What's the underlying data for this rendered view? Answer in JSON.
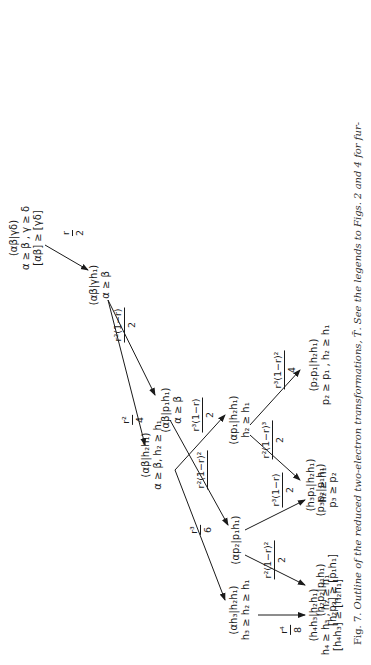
{
  "figure": {
    "caption_label": "Fig. 7.",
    "caption_text": "Outline of the reduced two-electron transformations, T̄. See the legends to Figs. 2 and 4 for fur-"
  },
  "nodes": {
    "root": {
      "l1": "(αβ|γδ)",
      "l2": "α ≥ β , γ ≥ δ",
      "l3": "[αβ] ≥ [γδ]"
    },
    "n_ab_gh1": {
      "l1": "(αβ|γh₁)",
      "l2": "α ≥ β"
    },
    "n_ab_p1h1": {
      "l1": "(αβ|p₁h₁)",
      "l2": "α ≥ β"
    },
    "n_ap2_p1h1": {
      "l1": "(αp₂|p₁h₁)"
    },
    "n_h2p2_p1h1": {
      "l1": "(h₂p₂|p₁h₁)",
      "l2": "[h₂p₂] ≥ [p₁h₁]"
    },
    "n_p3p2_p1h1": {
      "l1": "(p₃p₂|p₁h₁)",
      "l2": "p₃ ≥ p₂"
    },
    "n_ab_h2h1": {
      "l1": "(αβ|h₂h₁)",
      "l2": "α ≥ β, h₂ ≥ h₁"
    },
    "n_ap1_h2h1": {
      "l1": "(αp₁|h₂h₁)",
      "l2": "h₂ ≥ h₁"
    },
    "n_p2p1_h2h1": {
      "l1": "(p₂p₁|h₂h₁)",
      "l2": "p₂ ≥ p₁ , h₂ ≥ h₁"
    },
    "n_h3p1_h2h1": {
      "l1": "(h₃p₁|h₂h₁)",
      "l2": "h₂ ≥ h₁"
    },
    "n_ah3_h2h1": {
      "l1": "(αh₃|h₂h₁)",
      "l2": "h₃ ≥ h₂ ≥ h₁"
    },
    "n_h4h3_h2h1": {
      "l1": "(h₄h₃|h₂h₁)",
      "l2": "h₄ ≥ h₃ , h₂ ≥ h₁",
      "l3": "[h₄h₃] ≥ [h₂h₁]"
    }
  },
  "edges": {
    "e_root": {
      "num": "r",
      "den": "2"
    },
    "e_up1": {
      "num": "r²(1−r)",
      "den": "2"
    },
    "e_up2": {
      "num": "r²(1−r)²",
      "den": ""
    },
    "e_up3": {
      "num": "r²(1−r)²",
      "den": "2"
    },
    "e_up3b": {
      "num": "r²(1−r)³",
      "den": "2"
    },
    "e_down1": {
      "num": "r²",
      "den": "4"
    },
    "e_mid1": {
      "num": "r³(1−r)",
      "den": "2"
    },
    "e_mid2": {
      "num": "r³(1−r)²",
      "den": "4"
    },
    "e_mid2b": {
      "num": "r³(1−r)",
      "den": "2"
    },
    "e_down2": {
      "num": "r³",
      "den": "6"
    },
    "e_last": {
      "num": "r⁴",
      "den": "8"
    }
  }
}
